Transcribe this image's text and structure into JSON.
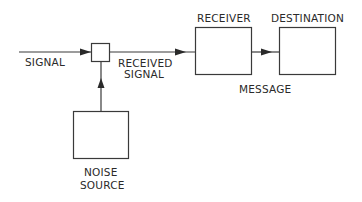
{
  "diagram": {
    "type": "communication-system block diagram",
    "labels": {
      "signal": "SIGNAL",
      "received_signal_line1": "RECEIVED",
      "received_signal_line2": "SIGNAL",
      "receiver": "RECEIVER",
      "destination": "DESTINATION",
      "message": "MESSAGE",
      "noise_line1": "NOISE",
      "noise_line2": "SOURCE"
    },
    "nodes": [
      {
        "id": "mixer",
        "label": ""
      },
      {
        "id": "receiver",
        "label": "RECEIVER"
      },
      {
        "id": "destination",
        "label": "DESTINATION"
      },
      {
        "id": "noise-source",
        "label": "NOISE SOURCE"
      }
    ],
    "edges": [
      {
        "from": "input",
        "to": "mixer",
        "label": "SIGNAL"
      },
      {
        "from": "noise-source",
        "to": "mixer",
        "label": ""
      },
      {
        "from": "mixer",
        "to": "receiver",
        "label": "RECEIVED SIGNAL"
      },
      {
        "from": "receiver",
        "to": "destination",
        "label": "MESSAGE"
      }
    ],
    "colors": {
      "stroke": "#3a3a3a",
      "text": "#2a2a2a",
      "background": "#ffffff"
    }
  }
}
